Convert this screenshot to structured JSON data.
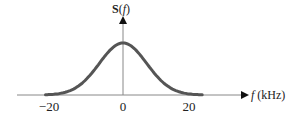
{
  "chart_data": {
    "type": "line",
    "title": "",
    "ylabel": "S(f)",
    "xlabel": "f (kHz)",
    "x_ticks": [
      -20,
      0,
      20
    ],
    "x_tick_labels": [
      "−20",
      "0",
      "20"
    ],
    "xlim": [
      -32,
      38
    ],
    "series": [
      {
        "name": "S(f)",
        "description": "Bell-shaped (Gaussian-like) spectrum centered at 0 kHz, negligible beyond ±20 kHz",
        "x": [
          -24,
          -20,
          -16,
          -12,
          -8,
          -4,
          0,
          4,
          8,
          12,
          16,
          20,
          24
        ],
        "values": [
          0.0,
          0.02,
          0.1,
          0.3,
          0.62,
          0.9,
          1.0,
          0.9,
          0.62,
          0.3,
          0.1,
          0.02,
          0.0
        ]
      }
    ],
    "grid": false,
    "legend": "none",
    "colors": {
      "curve": "#555555",
      "axes": "#888888",
      "arrows": "#111111"
    }
  },
  "labels": {
    "y_axis": "S(f)",
    "x_axis": "f (kHz)",
    "tick_neg20": "−20",
    "tick_0": "0",
    "tick_20": "20"
  }
}
